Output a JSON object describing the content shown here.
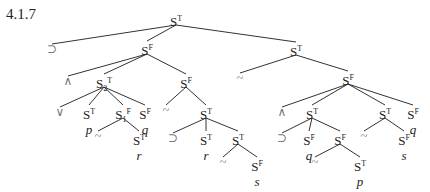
{
  "title": "4.1.7",
  "nodes": [
    {
      "id": "n0",
      "kind": "S",
      "sub": "",
      "sign": "T",
      "var": "",
      "x": 176,
      "y": 12
    },
    {
      "id": "o1",
      "kind": "op",
      "sym": "⊃",
      "x": 52,
      "y": 43
    },
    {
      "id": "n1",
      "kind": "S",
      "sub": "",
      "sign": "F",
      "var": "",
      "x": 147,
      "y": 41
    },
    {
      "id": "n2",
      "kind": "S",
      "sub": "",
      "sign": "T",
      "var": "",
      "x": 296,
      "y": 42
    },
    {
      "id": "o2",
      "kind": "op",
      "sym": "∧",
      "x": 68,
      "y": 75
    },
    {
      "id": "n3",
      "kind": "S",
      "sub": "2",
      "sign": "T",
      "var": "",
      "x": 104,
      "y": 74
    },
    {
      "id": "n4",
      "kind": "S",
      "sub": "",
      "sign": "F",
      "var": "",
      "x": 186,
      "y": 74
    },
    {
      "id": "o3",
      "kind": "op",
      "sym": "~",
      "x": 240,
      "y": 72
    },
    {
      "id": "n5",
      "kind": "S",
      "sub": "",
      "sign": "F",
      "var": "",
      "x": 348,
      "y": 71
    },
    {
      "id": "o4",
      "kind": "op",
      "sym": "∨",
      "x": 60,
      "y": 106
    },
    {
      "id": "n6",
      "kind": "S",
      "sub": "",
      "sign": "T",
      "var": "p",
      "x": 89,
      "y": 105
    },
    {
      "id": "n7",
      "kind": "S",
      "sub": "1",
      "sign": "F",
      "var": "",
      "x": 123,
      "y": 105
    },
    {
      "id": "n8",
      "kind": "S",
      "sub": "",
      "sign": "F",
      "var": "q",
      "x": 145,
      "y": 105
    },
    {
      "id": "o5",
      "kind": "op",
      "sym": "~",
      "x": 166,
      "y": 104
    },
    {
      "id": "n9",
      "kind": "S",
      "sub": "",
      "sign": "T",
      "var": "",
      "x": 206,
      "y": 105
    },
    {
      "id": "o6",
      "kind": "op",
      "sym": "∧",
      "x": 282,
      "y": 106
    },
    {
      "id": "n10",
      "kind": "S",
      "sub": "",
      "sign": "T",
      "var": "",
      "x": 312,
      "y": 105
    },
    {
      "id": "n11",
      "kind": "S",
      "sub": "",
      "sign": "T",
      "var": "",
      "x": 385,
      "y": 105
    },
    {
      "id": "n12",
      "kind": "S",
      "sub": "",
      "sign": "F",
      "var": "q",
      "x": 413,
      "y": 105
    },
    {
      "id": "o7",
      "kind": "op",
      "sym": "~",
      "x": 98,
      "y": 130
    },
    {
      "id": "n13",
      "kind": "S",
      "sub": "",
      "sign": "T",
      "var": "r",
      "x": 139,
      "y": 131
    },
    {
      "id": "o8",
      "kind": "op",
      "sym": "⊃",
      "x": 173,
      "y": 132
    },
    {
      "id": "n14",
      "kind": "S",
      "sub": "",
      "sign": "T",
      "var": "r",
      "x": 206,
      "y": 131
    },
    {
      "id": "n15",
      "kind": "S",
      "sub": "",
      "sign": "T",
      "var": "",
      "x": 238,
      "y": 131
    },
    {
      "id": "o9",
      "kind": "op",
      "sym": "⊃",
      "x": 282,
      "y": 132
    },
    {
      "id": "n16",
      "kind": "S",
      "sub": "",
      "sign": "F",
      "var": "q",
      "x": 309,
      "y": 131
    },
    {
      "id": "n17",
      "kind": "S",
      "sub": "",
      "sign": "F",
      "var": "",
      "x": 340,
      "y": 131
    },
    {
      "id": "o10",
      "kind": "op",
      "sym": "~",
      "x": 364,
      "y": 130
    },
    {
      "id": "n18",
      "kind": "S",
      "sub": "",
      "sign": "F",
      "var": "s",
      "x": 404,
      "y": 131
    },
    {
      "id": "o11",
      "kind": "op",
      "sym": "~",
      "x": 223,
      "y": 156
    },
    {
      "id": "n19",
      "kind": "S",
      "sub": "",
      "sign": "F",
      "var": "s",
      "x": 257,
      "y": 157
    },
    {
      "id": "o12",
      "kind": "op",
      "sym": "~",
      "x": 315,
      "y": 156
    },
    {
      "id": "n20",
      "kind": "S",
      "sub": "",
      "sign": "T",
      "var": "p",
      "x": 360,
      "y": 157
    }
  ],
  "edges": [
    [
      "n0",
      "o1"
    ],
    [
      "n0",
      "n1"
    ],
    [
      "n0",
      "n2"
    ],
    [
      "n1",
      "o2"
    ],
    [
      "n1",
      "n3"
    ],
    [
      "n1",
      "n4"
    ],
    [
      "n2",
      "o3"
    ],
    [
      "n2",
      "n5"
    ],
    [
      "n3",
      "o4"
    ],
    [
      "n3",
      "n6"
    ],
    [
      "n3",
      "n7"
    ],
    [
      "n3",
      "n8"
    ],
    [
      "n4",
      "o5"
    ],
    [
      "n4",
      "n9"
    ],
    [
      "n5",
      "o6"
    ],
    [
      "n5",
      "n10"
    ],
    [
      "n5",
      "n11"
    ],
    [
      "n5",
      "n12"
    ],
    [
      "n7",
      "o7"
    ],
    [
      "n7",
      "n13"
    ],
    [
      "n9",
      "o8"
    ],
    [
      "n9",
      "n14"
    ],
    [
      "n9",
      "n15"
    ],
    [
      "n10",
      "o9"
    ],
    [
      "n10",
      "n16"
    ],
    [
      "n10",
      "n17"
    ],
    [
      "n11",
      "o10"
    ],
    [
      "n11",
      "n18"
    ],
    [
      "n15",
      "o11"
    ],
    [
      "n15",
      "n19"
    ],
    [
      "n17",
      "o12"
    ],
    [
      "n17",
      "n20"
    ]
  ]
}
